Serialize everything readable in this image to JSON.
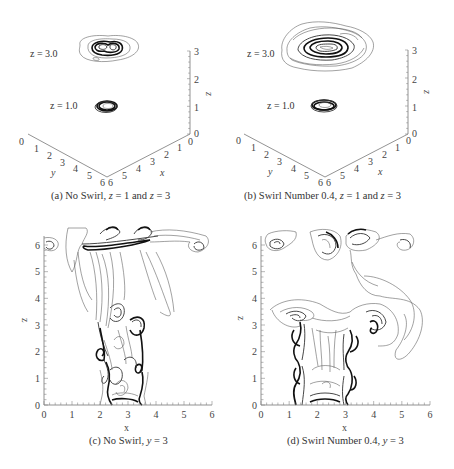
{
  "figure": {
    "type": "contour-panels",
    "colors": {
      "contour": "#222222",
      "axis": "#777777",
      "text": "#333333",
      "background": "#ffffff"
    }
  },
  "chart_data": [
    {
      "id": "a",
      "type": "contour-3d-slices",
      "caption_prefix": "(a) No Swirl, ",
      "caption_eq1": "z",
      "caption_mid": " = 1 and ",
      "caption_eq2": "z",
      "caption_end": " = 3",
      "slices": [
        {
          "label": "z = 3.0",
          "z": 3.0,
          "extent": "large irregular"
        },
        {
          "label": "z = 1.0",
          "z": 1.0,
          "extent": "small ring"
        }
      ],
      "axes": {
        "x": {
          "label": "x",
          "ticks": [
            "0",
            "1",
            "2",
            "3",
            "4",
            "5",
            "6"
          ],
          "range": [
            0,
            6
          ]
        },
        "y": {
          "label": "y",
          "ticks": [
            "0",
            "1",
            "2",
            "3",
            "4",
            "5",
            "6"
          ],
          "range": [
            0,
            6
          ]
        },
        "z": {
          "label": "z",
          "ticks": [
            "0",
            "1",
            "2",
            "3"
          ],
          "range": [
            0,
            3
          ]
        }
      }
    },
    {
      "id": "b",
      "type": "contour-3d-slices",
      "caption_prefix": "(b) Swirl Number 0.4,  ",
      "caption_eq1": "z",
      "caption_mid": " = 1 and ",
      "caption_eq2": "z",
      "caption_end": " = 3",
      "slices": [
        {
          "label": "z = 3.0",
          "z": 3.0,
          "extent": "wide spread"
        },
        {
          "label": "z = 1.0",
          "z": 1.0,
          "extent": "small ring"
        }
      ],
      "axes": {
        "x": {
          "label": "x",
          "ticks": [
            "0",
            "1",
            "2",
            "3",
            "4",
            "5",
            "6"
          ],
          "range": [
            0,
            6
          ]
        },
        "y": {
          "label": "y",
          "ticks": [
            "0",
            "1",
            "2",
            "3",
            "4",
            "5",
            "6"
          ],
          "range": [
            0,
            6
          ]
        },
        "z": {
          "label": "z",
          "ticks": [
            "0",
            "1",
            "2",
            "3"
          ],
          "range": [
            0,
            3
          ]
        }
      }
    },
    {
      "id": "c",
      "type": "contour",
      "caption_prefix": "(c) No Swirl, ",
      "caption_var": "y",
      "caption_end": " = 3",
      "xlabel": "x",
      "ylabel": "z",
      "xlim": [
        0,
        6
      ],
      "ylim": [
        0,
        6
      ],
      "xticks": [
        "0",
        "1",
        "2",
        "3",
        "4",
        "5",
        "6"
      ],
      "yticks": [
        "0",
        "1",
        "2",
        "3",
        "4",
        "5",
        "6"
      ],
      "jet_inlet": [
        2.4,
        3.6
      ],
      "plume_top_z": 5.4
    },
    {
      "id": "d",
      "type": "contour",
      "caption_prefix": "(d) Swirl Number 0.4, ",
      "caption_var": "y",
      "caption_end": " = 3",
      "xlabel": "x",
      "ylabel": "z",
      "xlim": [
        0,
        6
      ],
      "ylim": [
        0,
        6
      ],
      "xticks": [
        "0",
        "1",
        "2",
        "3",
        "4",
        "5",
        "6"
      ],
      "yticks": [
        "0",
        "1",
        "2",
        "3",
        "4",
        "5",
        "6"
      ],
      "jet_inlet": [
        2.4,
        3.6
      ],
      "plume_spread_z": 3.2
    }
  ]
}
